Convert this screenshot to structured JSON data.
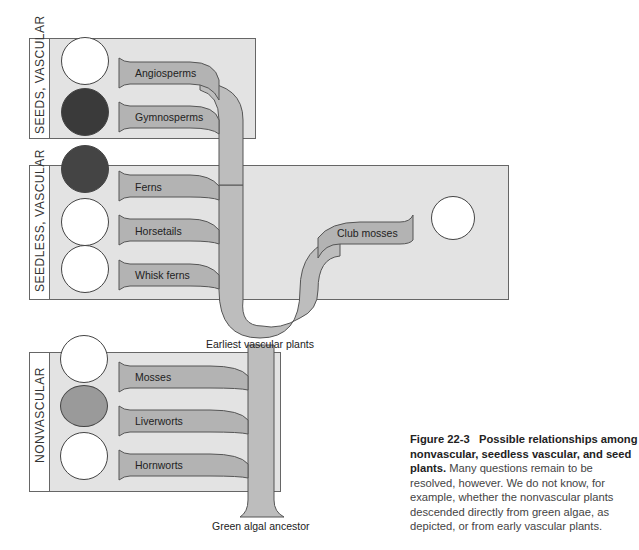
{
  "groups": [
    {
      "label": "SEEDS, VASCULAR"
    },
    {
      "label": "SEEDLESS, VASCULAR"
    },
    {
      "label": "NONVASCULAR"
    }
  ],
  "branches": {
    "angiosperms": "Angiosperms",
    "gymnosperms": "Gymnosperms",
    "ferns": "Ferns",
    "horsetails": "Horsetails",
    "whisk_ferns": "Whisk ferns",
    "club_mosses": "Club mosses",
    "mosses": "Mosses",
    "liverworts": "Liverworts",
    "hornworts": "Hornworts"
  },
  "nodes": {
    "earliest_vascular": "Earliest vascular plants",
    "green_algal_ancestor": "Green algal ancestor"
  },
  "icons": [
    "flower-icon",
    "conifer-cone-icon",
    "fern-frond-icon",
    "horsetail-icon",
    "whisk-fern-icon",
    "club-moss-icon",
    "moss-icon",
    "liverwort-icon",
    "hornwort-icon"
  ],
  "caption": {
    "figure_number": "Figure 22-3",
    "title": "Possible relationships among nonvascular, seedless vascular, and seed plants.",
    "body": "Many questions remain to be resolved, however. We do not know, for example, whether the nonvascular plants descended directly from green algae, as depicted, or from early vascular plants."
  },
  "colors": {
    "box_fill": "#e3e3e3",
    "branch_fill": "#b3b3b3",
    "trunk_fill": "#bdbdbd",
    "outline": "#555555"
  }
}
